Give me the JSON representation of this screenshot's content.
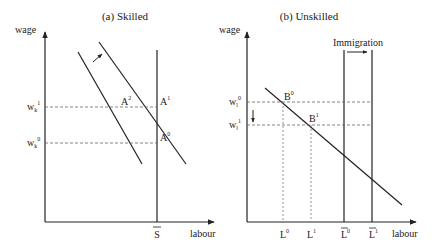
{
  "panels": [
    {
      "id": "skilled",
      "title": "(a) Skilled",
      "y_axis_label": "wage",
      "x_axis_label": "labour",
      "x_tick": "S",
      "wage_levels": [
        {
          "base": "w",
          "sub": "k",
          "sup": "1"
        },
        {
          "base": "w",
          "sub": "k",
          "sup": "0"
        }
      ],
      "points": [
        {
          "base": "A",
          "sup": "2"
        },
        {
          "base": "A",
          "sup": "1"
        },
        {
          "base": "A",
          "sup": "0"
        }
      ],
      "shift_arrow": "demand-shift-right"
    },
    {
      "id": "unskilled",
      "title": "(b) Unskilled",
      "y_axis_label": "wage",
      "x_axis_label": "labour",
      "annotation": "Immigration",
      "x_ticks": [
        {
          "base": "L",
          "sup": "0",
          "bar": false
        },
        {
          "base": "L",
          "sup": "1",
          "bar": false
        },
        {
          "base": "L",
          "sup": "0",
          "bar": true
        },
        {
          "base": "L",
          "sup": "1",
          "bar": true
        }
      ],
      "wage_levels": [
        {
          "base": "w",
          "sub": "l",
          "sup": "0"
        },
        {
          "base": "w",
          "sub": "l",
          "sup": "1"
        }
      ],
      "points": [
        {
          "base": "B",
          "sup": "0"
        },
        {
          "base": "B",
          "sup": "1"
        }
      ],
      "shift_arrow": "wage-decrease"
    }
  ]
}
